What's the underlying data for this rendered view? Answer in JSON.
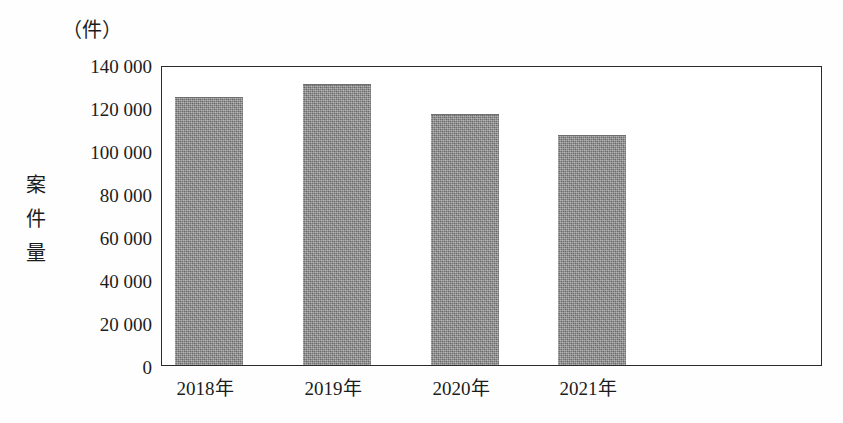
{
  "chart_data": {
    "type": "bar",
    "title": "",
    "subtitle": "",
    "unit_label": "（件）",
    "ylabel": "案件量",
    "xlabel": "",
    "categories": [
      "2018年",
      "2019年",
      "2020年",
      "2021年"
    ],
    "values": [
      125500,
      131500,
      117500,
      107500
    ],
    "series": [
      {
        "name": "案件量",
        "values": [
          125500,
          131500,
          117500,
          107500
        ]
      }
    ],
    "ylim": [
      0,
      140000
    ],
    "ytick_values": [
      0,
      20000,
      40000,
      60000,
      80000,
      100000,
      120000,
      140000
    ],
    "ytick_labels": [
      "0",
      "20 000",
      "40 000",
      "60 000",
      "80 000",
      "100 000",
      "120 000",
      "140 000"
    ],
    "grid": false,
    "legend": false,
    "legend_position": "none",
    "bar_color": "#8d8d8d",
    "axis_color": "#2b2b2b",
    "background_color": "#ffffff"
  },
  "axis": {
    "y_title_chars": [
      "案",
      "件",
      "量"
    ]
  }
}
